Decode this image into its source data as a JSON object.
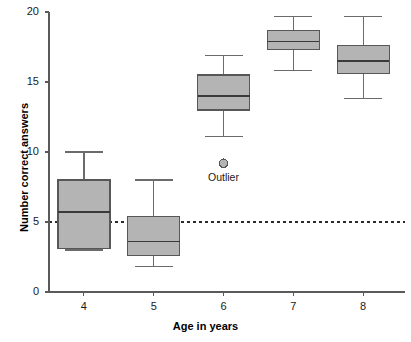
{
  "chart_data": {
    "type": "box",
    "title": "",
    "xlabel": "Age in years",
    "ylabel": "Number correct answers",
    "categories": [
      "4",
      "5",
      "6",
      "7",
      "8"
    ],
    "xlim": [
      3.5,
      8.6
    ],
    "ylim": [
      0,
      20
    ],
    "yticks": [
      "0",
      "5",
      "10",
      "15",
      "20"
    ],
    "ytick_values": [
      0,
      5,
      10,
      15,
      20
    ],
    "xticks": [
      "4",
      "5",
      "6",
      "7",
      "8"
    ],
    "grid": false,
    "legend": "none",
    "reference_line": {
      "value": 5,
      "style": "dashed",
      "label": ""
    },
    "boxes": [
      {
        "category": "4",
        "whisker_low": 3.0,
        "q1": 3.1,
        "median": 5.7,
        "q3": 8.0,
        "whisker_high": 10.0
      },
      {
        "category": "5",
        "whisker_low": 1.8,
        "q1": 2.6,
        "median": 3.6,
        "q3": 5.4,
        "whisker_high": 8.0
      },
      {
        "category": "6",
        "whisker_low": 11.1,
        "q1": 13.0,
        "median": 14.0,
        "q3": 15.5,
        "whisker_high": 16.9
      },
      {
        "category": "7",
        "whisker_low": 15.8,
        "q1": 17.3,
        "median": 17.9,
        "q3": 18.7,
        "whisker_high": 19.7
      },
      {
        "category": "8",
        "whisker_low": 13.8,
        "q1": 15.6,
        "median": 16.5,
        "q3": 17.6,
        "whisker_high": 19.7
      }
    ],
    "outliers": [
      {
        "category": "6",
        "value": 9.2,
        "label": "Outlier"
      }
    ]
  },
  "colors": {
    "box_fill": "#b4b4b4",
    "box_stroke": "#575757",
    "axis": "#5a5a5a",
    "reference_line": "#2b2b2b",
    "background": "#ffffff"
  }
}
